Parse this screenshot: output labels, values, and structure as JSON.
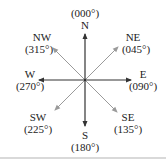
{
  "diagram": {
    "type": "compass-rose",
    "colors": {
      "cardinal_arrow": "#333333",
      "intercardinal_arrow": "#9a9a9a",
      "text": "#222222",
      "separator": "#d9d9d9"
    },
    "directions": [
      {
        "key": "n",
        "abbr": "N",
        "bearing": "(000°)"
      },
      {
        "key": "ne",
        "abbr": "NE",
        "bearing": "(045°)"
      },
      {
        "key": "e",
        "abbr": "E",
        "bearing": "(090°)"
      },
      {
        "key": "se",
        "abbr": "SE",
        "bearing": "(135°)"
      },
      {
        "key": "s",
        "abbr": "S",
        "bearing": "(180°)"
      },
      {
        "key": "sw",
        "abbr": "SW",
        "bearing": "(225°)"
      },
      {
        "key": "w",
        "abbr": "W",
        "bearing": "(270°)"
      },
      {
        "key": "nw",
        "abbr": "NW",
        "bearing": "(315°)"
      }
    ]
  }
}
